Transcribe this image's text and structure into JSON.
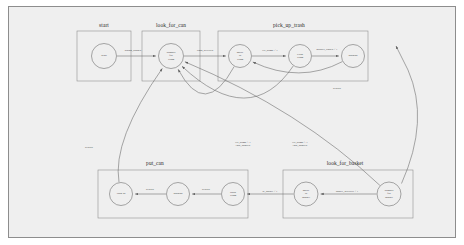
{
  "diagram": {
    "canvas": {
      "width": 464,
      "height": 245,
      "background": "#ffffff",
      "plate_fill": "#efefef",
      "plate_stroke": "#8d8d8d"
    },
    "stroke_color": "#6e6e6e",
    "text_color": "#2b2b2b"
  },
  "clusters": [
    {
      "id": "start",
      "label": "start",
      "x": 77,
      "y": 31,
      "w": 54,
      "h": 50,
      "label_x": 104,
      "label_y": 22
    },
    {
      "id": "look_for_can",
      "label": "look_for_can",
      "x": 142,
      "y": 31,
      "w": 58,
      "h": 50,
      "label_x": 171,
      "label_y": 22
    },
    {
      "id": "pick_up_trash",
      "label": "pick_up_trash",
      "x": 218,
      "y": 31,
      "w": 150,
      "h": 50,
      "label_x": 289,
      "label_y": 22
    },
    {
      "id": "put_can",
      "label": "put_can",
      "x": 98,
      "y": 170,
      "w": 150,
      "h": 48,
      "label_x": 155,
      "label_y": 160
    },
    {
      "id": "look_for_basket",
      "label": "look_for_basket",
      "x": 283,
      "y": 170,
      "w": 130,
      "h": 48,
      "label_x": 345,
      "label_y": 160
    }
  ],
  "nodes": [
    {
      "id": "start",
      "lines": [
        "Start"
      ],
      "cx": 104,
      "cy": 56,
      "r": 12.5
    },
    {
      "id": "wander_trash",
      "lines": [
        "Wander",
        "for",
        "Trash"
      ],
      "cx": 171,
      "cy": 56,
      "r": 12.5
    },
    {
      "id": "move_to_trash",
      "lines": [
        "Move",
        "to",
        "Trash"
      ],
      "cx": 240,
      "cy": 56,
      "r": 11.5
    },
    {
      "id": "grab_trash",
      "lines": [
        "Grab",
        "Trash"
      ],
      "cx": 300,
      "cy": 56,
      "r": 11.5
    },
    {
      "id": "backup_top",
      "lines": [
        "Backup"
      ],
      "cx": 353,
      "cy": 56,
      "r": 11.5
    },
    {
      "id": "turn_90",
      "lines": [
        "Turn 90"
      ],
      "cx": 121,
      "cy": 194,
      "r": 11.5
    },
    {
      "id": "backup_bottom",
      "lines": [
        "Backup"
      ],
      "cx": 178,
      "cy": 194,
      "r": 11.5
    },
    {
      "id": "drop_trash",
      "lines": [
        "Drop",
        "Trash"
      ],
      "cx": 233,
      "cy": 194,
      "r": 11.5
    },
    {
      "id": "move_to_basket",
      "lines": [
        "Move",
        "to",
        "Basket"
      ],
      "cx": 306,
      "cy": 194,
      "r": 12
    },
    {
      "id": "wander_basket",
      "lines": [
        "Wander",
        "for",
        "Basket"
      ],
      "cx": 389,
      "cy": 194,
      "r": 12
    }
  ],
  "edges": [
    {
      "id": "start-to-wander",
      "label": "button_pushed",
      "label_x": 133,
      "label_y": 51
    },
    {
      "id": "wander-to-move-trash",
      "label": "trash_detected",
      "label_x": 205,
      "label_y": 51
    },
    {
      "id": "move-trash-to-grab",
      "label": "tilt_bump < 1",
      "label_x": 270,
      "label_y": 51
    },
    {
      "id": "grab-to-backup-top",
      "label": "gripper_closed < 1",
      "label_x": 327,
      "label_y": 50
    },
    {
      "id": "backup-top-to-wander",
      "label": "always",
      "label_x": 337,
      "label_y": 89
    },
    {
      "id": "move-trash-to-wander",
      "label": "tilt_bump > 1",
      "label_x": 243,
      "label_y": 144,
      "label2": "task_aborted",
      "label2_y": 148
    },
    {
      "id": "grab-to-wander",
      "label": "tilt_bump > 1",
      "label_x": 300,
      "label_y": 144,
      "label2": "task_aborted",
      "label2_y": 148
    },
    {
      "id": "wander-basket-to-move",
      "label": "basket_detected < 1",
      "label_x": 347,
      "label_y": 192
    },
    {
      "id": "move-basket-to-drop",
      "label": "at_basket < 1",
      "label_x": 270,
      "label_y": 192
    },
    {
      "id": "drop-to-backup-bottom",
      "label": "always",
      "label_x": 206,
      "label_y": 190
    },
    {
      "id": "backup-bottom-to-turn",
      "label": "always",
      "label_x": 150,
      "label_y": 190
    },
    {
      "id": "turn-to-wander-trash",
      "label": "always",
      "label_x": 89,
      "label_y": 148
    }
  ]
}
